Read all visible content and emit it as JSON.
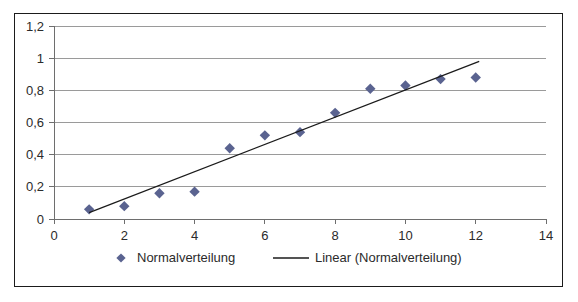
{
  "chart_data": {
    "type": "scatter",
    "title": "",
    "xlabel": "",
    "ylabel": "",
    "xlim": [
      0,
      14
    ],
    "ylim": [
      0,
      1.2
    ],
    "grid": true,
    "grid_axis": "y",
    "legend_position": "bottom",
    "decimal_separator": ",",
    "x_ticks": [
      "0",
      "2",
      "4",
      "6",
      "8",
      "10",
      "12",
      "14"
    ],
    "x_tick_values": [
      0,
      2,
      4,
      6,
      8,
      10,
      12,
      14
    ],
    "y_ticks": [
      "0",
      "0,2",
      "0,4",
      "0,6",
      "0,8",
      "1",
      "1,2"
    ],
    "y_tick_values": [
      0,
      0.2,
      0.4,
      0.6,
      0.8,
      1,
      1.2
    ],
    "series": [
      {
        "name": "Normalverteilung",
        "type": "scatter",
        "marker": "diamond",
        "color": "#5a6390",
        "x": [
          1,
          2,
          3,
          4,
          5,
          6,
          7,
          8,
          9,
          10,
          11,
          12
        ],
        "values": [
          0.06,
          0.08,
          0.16,
          0.17,
          0.44,
          0.52,
          0.54,
          0.66,
          0.81,
          0.83,
          0.87,
          0.88
        ]
      },
      {
        "name": "Linear (Normalverteilung)",
        "type": "line",
        "color": "#1b1b1b",
        "x": [
          1.0,
          12.1
        ],
        "values": [
          0.04,
          0.98
        ]
      }
    ]
  },
  "legend": {
    "items": [
      {
        "label": "Normalverteilung",
        "marker": "diamond",
        "color": "#5a6390"
      },
      {
        "label": "Linear (Normalverteilung)",
        "marker": "line",
        "color": "#1b1b1b"
      }
    ]
  },
  "colors": {
    "marker": "#5a6390",
    "trendline": "#1b1b1b",
    "gridline": "#9a9a9a",
    "axis": "#6e6e6e",
    "frame": "#1b1b1b",
    "text": "#2b2b2b",
    "background": "#ffffff"
  }
}
